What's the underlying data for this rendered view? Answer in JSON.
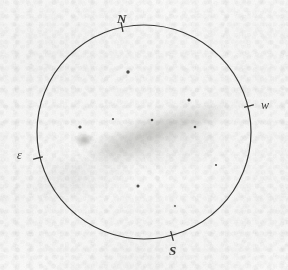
{
  "sketch": {
    "medium": "pencil-on-paper",
    "paper_color": "#fbfbfa",
    "ink_color": "#3a3a38",
    "nebula_color": "#9a9a98"
  },
  "field_circle": {
    "center_x": 144,
    "center_y": 132,
    "radius": 107,
    "stroke_color": "#3a3a38",
    "stroke_width": 1.2
  },
  "orientation": {
    "north": {
      "label": "N",
      "tick_x": 122,
      "tick_y": 27,
      "angle_deg": -101
    },
    "west": {
      "label": "w",
      "tick_x": 249,
      "tick_y": 106,
      "angle_deg": -14
    },
    "east": {
      "label": "ε",
      "tick_x": 38,
      "tick_y": 158,
      "angle_deg": 166
    },
    "south": {
      "label": "S",
      "tick_x": 172,
      "tick_y": 236,
      "angle_deg": 75
    }
  },
  "deep_sky_object": {
    "type": "edge-on-galaxy",
    "position_angle_deg": -22,
    "core": {
      "x": 84,
      "y": 140,
      "rx": 9,
      "ry": 7,
      "opacity": 0.52
    },
    "halo_layers": [
      {
        "x": 158,
        "y": 133,
        "rx": 78,
        "ry": 27,
        "rotate": -19,
        "opacity": 0.1
      },
      {
        "x": 152,
        "y": 134,
        "rx": 70,
        "ry": 22,
        "rotate": -20,
        "opacity": 0.13
      },
      {
        "x": 148,
        "y": 134,
        "rx": 60,
        "ry": 17,
        "rotate": -21,
        "opacity": 0.16
      },
      {
        "x": 145,
        "y": 134,
        "rx": 48,
        "ry": 13,
        "rotate": -22,
        "opacity": 0.17
      },
      {
        "x": 185,
        "y": 121,
        "rx": 44,
        "ry": 13,
        "rotate": -17,
        "opacity": 0.15
      },
      {
        "x": 205,
        "y": 116,
        "rx": 32,
        "ry": 10,
        "rotate": -15,
        "opacity": 0.13
      },
      {
        "x": 112,
        "y": 146,
        "rx": 34,
        "ry": 15,
        "rotate": -14,
        "opacity": 0.15
      },
      {
        "x": 128,
        "y": 152,
        "rx": 38,
        "ry": 14,
        "rotate": -8,
        "opacity": 0.12
      }
    ],
    "outer_smudge": [
      {
        "x": 96,
        "y": 172,
        "rx": 36,
        "ry": 17,
        "rotate": -12,
        "opacity": 0.07
      },
      {
        "x": 62,
        "y": 180,
        "rx": 26,
        "ry": 20,
        "rotate": -30,
        "opacity": 0.06
      },
      {
        "x": 176,
        "y": 150,
        "rx": 42,
        "ry": 16,
        "rotate": -16,
        "opacity": 0.06
      }
    ]
  },
  "stars": [
    {
      "x": 128,
      "y": 72,
      "r": 1.7
    },
    {
      "x": 189,
      "y": 100,
      "r": 1.5
    },
    {
      "x": 80,
      "y": 127,
      "r": 1.6
    },
    {
      "x": 113,
      "y": 119,
      "r": 1.1
    },
    {
      "x": 152,
      "y": 120,
      "r": 1.3
    },
    {
      "x": 195,
      "y": 127,
      "r": 1.3
    },
    {
      "x": 138,
      "y": 186,
      "r": 1.5
    },
    {
      "x": 216,
      "y": 165,
      "r": 1.1
    },
    {
      "x": 175,
      "y": 206,
      "r": 0.9
    }
  ]
}
